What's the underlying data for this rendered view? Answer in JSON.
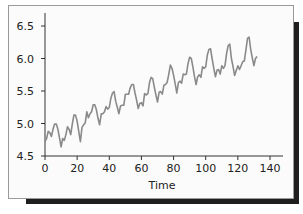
{
  "chart_data": {
    "type": "line",
    "title": "",
    "xlabel": "Time",
    "ylabel": "",
    "xlim": [
      0,
      140
    ],
    "ylim": [
      4.5,
      6.6
    ],
    "x_ticks": [
      0,
      20,
      40,
      60,
      80,
      100,
      120,
      140
    ],
    "y_ticks": [
      4.5,
      5.0,
      5.5,
      6.0,
      6.5
    ],
    "x_tick_labels": [
      "0",
      "20",
      "40",
      "60",
      "80",
      "100",
      "120",
      "140"
    ],
    "y_tick_labels": [
      "4.5",
      "5.0",
      "5.5",
      "6.0",
      "6.5"
    ],
    "grid": false,
    "legend": null,
    "line_color": "#8a8a8a",
    "series": [
      {
        "name": "series",
        "x_start": 1,
        "values": [
          4.72,
          4.77,
          4.88,
          4.86,
          4.8,
          4.91,
          4.99,
          4.99,
          4.91,
          4.78,
          4.64,
          4.77,
          4.74,
          4.83,
          4.95,
          4.91,
          4.83,
          4.99,
          5.13,
          5.13,
          5.04,
          4.87,
          4.72,
          4.94,
          4.98,
          5.01,
          5.18,
          5.09,
          5.15,
          5.18,
          5.29,
          5.29,
          5.21,
          5.08,
          4.98,
          5.15,
          5.15,
          5.18,
          5.26,
          5.22,
          5.25,
          5.39,
          5.47,
          5.49,
          5.34,
          5.25,
          5.15,
          5.27,
          5.28,
          5.28,
          5.45,
          5.45,
          5.45,
          5.55,
          5.6,
          5.6,
          5.47,
          5.36,
          5.23,
          5.31,
          5.32,
          5.27,
          5.46,
          5.44,
          5.46,
          5.63,
          5.71,
          5.69,
          5.56,
          5.44,
          5.33,
          5.48,
          5.49,
          5.45,
          5.59,
          5.6,
          5.63,
          5.76,
          5.9,
          5.85,
          5.74,
          5.61,
          5.47,
          5.63,
          5.65,
          5.62,
          5.76,
          5.75,
          5.76,
          5.92,
          6.02,
          6.0,
          5.87,
          5.72,
          5.6,
          5.72,
          5.75,
          5.71,
          5.87,
          5.85,
          5.87,
          6.05,
          6.14,
          6.15,
          6.0,
          5.85,
          5.72,
          5.82,
          5.83,
          5.76,
          5.89,
          5.85,
          5.89,
          6.08,
          6.2,
          6.22,
          6.0,
          5.88,
          5.74,
          5.82,
          5.89,
          5.83,
          5.89,
          5.95,
          5.96,
          6.13,
          6.31,
          6.33,
          6.14,
          6.01,
          5.89,
          6.0,
          6.03
        ]
      }
    ]
  }
}
